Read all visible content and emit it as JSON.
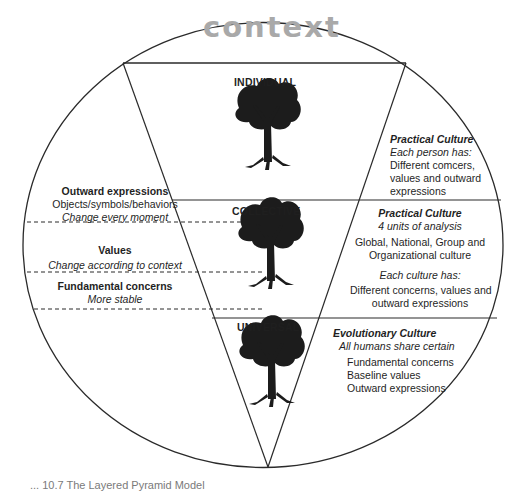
{
  "diagram": {
    "context_label": "context",
    "levels": [
      {
        "label": "INDIVIDUAL"
      },
      {
        "label": "COLLECTIVE"
      },
      {
        "label": "UNIVERSAL"
      }
    ],
    "left_panel": {
      "outward": {
        "title": "Outward expressions",
        "line1": "Objects/symbols/behaviors",
        "line2": "Change every moment"
      },
      "values": {
        "title": "Values",
        "line1": "Change according to context"
      },
      "fundamental": {
        "title": "Fundamental concerns",
        "line1": "More stable"
      }
    },
    "right_panel": {
      "individual": {
        "title": "Practical Culture",
        "subtitle": "Each person has:",
        "lines": [
          "Different comcers,",
          "values and outward",
          "expressions"
        ]
      },
      "collective": {
        "title": "Practical Culture",
        "subtitle": "4 units of analysis",
        "lines": [
          "Global, National, Group and",
          "Organizational culture"
        ],
        "subtitle2": "Each culture has:",
        "lines2": [
          "Different concerns, values and",
          "outward expressions"
        ]
      },
      "universal": {
        "title": "Evolutionary Culture",
        "subtitle": "All humans share certain",
        "lines": [
          "Fundamental concerns",
          "Baseline values",
          "Outward expressions"
        ]
      }
    },
    "caption": "... 10.7 The Layered Pyramid Model"
  },
  "colors": {
    "line": "#2a2a2a",
    "context_text": "#a9a9a9",
    "tree": "#1c1c1c"
  }
}
